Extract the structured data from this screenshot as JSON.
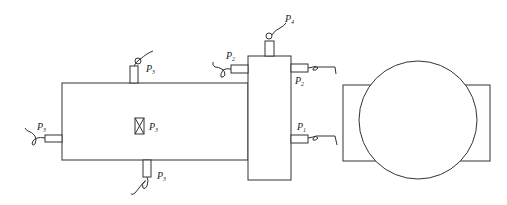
{
  "diagram": {
    "components": [
      {
        "id": "main-tank",
        "type": "horizontal-vessel"
      },
      {
        "id": "separator-column",
        "type": "vertical-vessel"
      },
      {
        "id": "pump-motor",
        "type": "rotating-machine"
      }
    ],
    "labels": {
      "p3_top": {
        "main": "P",
        "sub": "3"
      },
      "p3_left": {
        "main": "P",
        "sub": "3"
      },
      "p3_center": {
        "main": "P",
        "sub": "3"
      },
      "p3_bottom": {
        "main": "P",
        "sub": "3"
      },
      "p4_top": {
        "main": "P",
        "sub": "4"
      },
      "p2_left": {
        "main": "P",
        "sub": "2"
      },
      "p2_right": {
        "main": "P",
        "sub": "2"
      },
      "p1_right": {
        "main": "P",
        "sub": "1"
      }
    },
    "colors": {
      "line": "#333333",
      "background": "#ffffff"
    }
  }
}
